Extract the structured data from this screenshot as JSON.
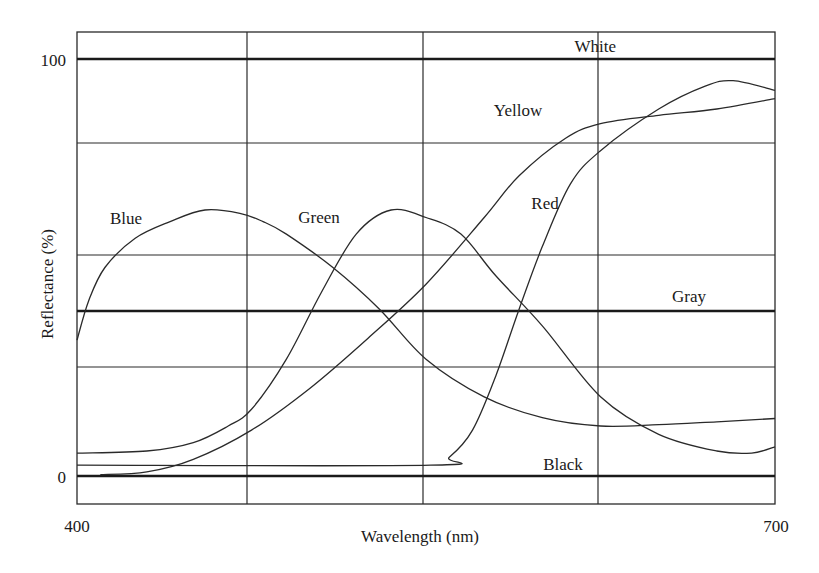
{
  "chart_data": {
    "type": "line",
    "title": "",
    "xlabel": "Wavelength (nm)",
    "ylabel": "Reflectance (%)",
    "xlim": [
      400,
      700
    ],
    "ylim": [
      -7,
      106
    ],
    "x_tick_labels": [
      "400",
      "700"
    ],
    "y_tick_labels": [
      "0",
      "100"
    ],
    "grid": true,
    "vertical_gridlines_nm": [
      475,
      550,
      625
    ],
    "horizontal_gridlines_pct": [
      80,
      53.2,
      26.4
    ],
    "reference_lines": [
      {
        "name": "White",
        "value": 100
      },
      {
        "name": "Gray",
        "value": 39.5
      },
      {
        "name": "Black",
        "value": 0
      }
    ],
    "series": [
      {
        "name": "Blue",
        "x": [
          400,
          405,
          412,
          425,
          440,
          455,
          470,
          480,
          490,
          510,
          530,
          550,
          575,
          600,
          625,
          650,
          675,
          700
        ],
        "values": [
          32.6,
          42,
          50,
          57,
          61,
          63.8,
          63,
          61,
          58,
          50,
          40,
          28,
          19,
          14,
          12,
          12.3,
          13,
          13.8
        ]
      },
      {
        "name": "Green",
        "x": [
          400,
          430,
          450,
          465,
          475,
          490,
          505,
          520,
          535,
          550,
          565,
          580,
          600,
          625,
          650,
          675,
          690,
          700
        ],
        "values": [
          5.5,
          6,
          8,
          12,
          16,
          28,
          44,
          58,
          63.8,
          62,
          58,
          48,
          36,
          19,
          10,
          6,
          5.5,
          7
        ]
      },
      {
        "name": "Yellow",
        "x": [
          410,
          430,
          450,
          475,
          500,
          525,
          550,
          575,
          590,
          610,
          625,
          650,
          675,
          700
        ],
        "values": [
          0.3,
          1,
          4,
          11,
          21,
          33,
          46,
          62,
          72,
          81,
          84.5,
          86.5,
          88,
          90.5
        ]
      },
      {
        "name": "Red",
        "x": [
          400,
          552,
          560,
          570,
          580,
          590,
          600,
          612,
          625,
          650,
          670,
          682,
          700
        ],
        "values": [
          2.6,
          2.6,
          4.5,
          11,
          24,
          40,
          55,
          70,
          78,
          88,
          93.5,
          94.8,
          92.5
        ]
      }
    ]
  },
  "labels": {
    "white": "White",
    "yellow": "Yellow",
    "blue": "Blue",
    "green": "Green",
    "red": "Red",
    "gray": "Gray",
    "black": "Black",
    "y100": "100",
    "y0": "0",
    "x400": "400",
    "x700": "700",
    "xlabel": "Wavelength (nm)",
    "ylabel": "Reflectance (%)"
  },
  "style": {
    "line_color": "#2a2a2a",
    "background": "#ffffff"
  }
}
